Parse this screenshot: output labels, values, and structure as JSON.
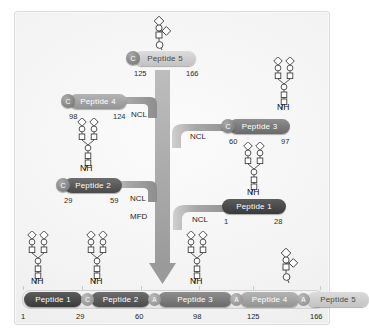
{
  "figure": {
    "panel_background": "#f3f3f3"
  },
  "reaction_labels": {
    "ncl": "NCL",
    "mfd": "MFD"
  },
  "markers": {
    "cysteine": "C",
    "alanine": "A",
    "amide": "NH"
  },
  "segments": [
    {
      "id": "peptide-5",
      "label": "Peptide 5",
      "start": "125",
      "end": "166",
      "nterm_marker": "C",
      "glycan": "o-linked-short",
      "shade": "p5"
    },
    {
      "id": "peptide-4",
      "label": "Peptide 4",
      "start": "98",
      "end": "124",
      "nterm_marker": "C",
      "glycan": "n-linked-biantennary",
      "shade": "p4"
    },
    {
      "id": "peptide-3",
      "label": "Peptide 3",
      "start": "60",
      "end": "97",
      "nterm_marker": "C",
      "glycan": "n-linked-biantennary",
      "shade": "p3"
    },
    {
      "id": "peptide-2",
      "label": "Peptide 2",
      "start": "29",
      "end": "59",
      "nterm_marker": "C",
      "glycan": "n-linked-biantennary",
      "shade": "p2"
    },
    {
      "id": "peptide-1",
      "label": "Peptide 1",
      "start": "1",
      "end": "28",
      "nterm_marker": "",
      "glycan": "n-linked-biantennary",
      "shade": "p1"
    }
  ],
  "ligations": [
    {
      "name": "ligation-peptide5-peptide4",
      "label": "NCL"
    },
    {
      "name": "ligation-peptide3",
      "label": "NCL"
    },
    {
      "name": "ligation-peptide2",
      "label": "NCL"
    },
    {
      "name": "ligation-peptide1",
      "label": "NCL"
    },
    {
      "name": "desulfurization",
      "label": "MFD"
    }
  ],
  "product": {
    "name": "full-length-glycoprotein",
    "blocks": [
      {
        "label": "Peptide 1",
        "shade": "p1"
      },
      {
        "label": "Peptide 2",
        "shade": "p2"
      },
      {
        "label": "Peptide 3",
        "shade": "p3"
      },
      {
        "label": "Peptide 4",
        "shade": "p4"
      },
      {
        "label": "Peptide 5",
        "shade": "p5"
      }
    ],
    "junctions": [
      "C",
      "A",
      "A",
      "A"
    ],
    "positions": [
      "1",
      "29",
      "60",
      "98",
      "125",
      "166"
    ]
  }
}
